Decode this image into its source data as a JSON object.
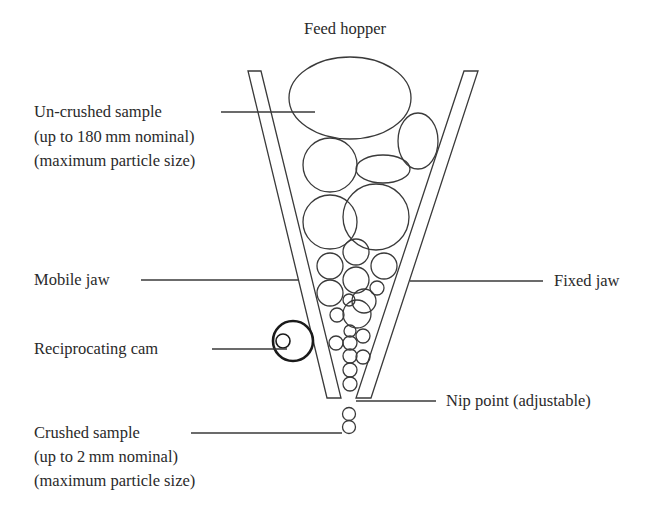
{
  "diagram": {
    "title": "Feed hopper",
    "labels": {
      "uncrushed": {
        "line1": "Un-crushed sample",
        "line2": "(up to 180 mm nominal)",
        "line3": "(maximum particle size)"
      },
      "mobile_jaw": "Mobile jaw",
      "fixed_jaw": "Fixed jaw",
      "reciprocating_cam": "Reciprocating cam",
      "nip_point": "Nip point (adjustable)",
      "crushed": {
        "line1": "Crushed sample",
        "line2": "(up to 2 mm nominal)",
        "line3": "(maximum particle size)"
      }
    },
    "colors": {
      "line": "#3a3a3a",
      "cam": "#1a1a1a",
      "text": "#2a2a2a",
      "background": "#ffffff"
    }
  }
}
